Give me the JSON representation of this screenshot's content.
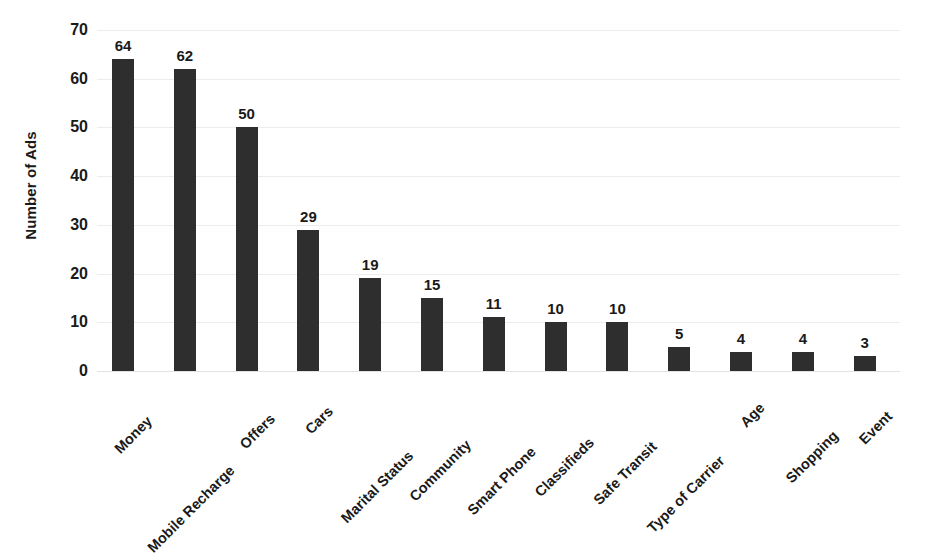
{
  "chart_data": {
    "type": "bar",
    "title": "",
    "subtitle": "",
    "xlabel": "",
    "ylabel": "Number of Ads",
    "categories": [
      "Money",
      "Mobile Recharge",
      "Offers",
      "Cars",
      "Marital Status",
      "Community",
      "Smart Phone",
      "Classifieds",
      "Safe Transit",
      "Type of Carrier",
      "Age",
      "Shopping",
      "Event"
    ],
    "values": [
      64,
      62,
      50,
      29,
      19,
      15,
      11,
      10,
      10,
      5,
      4,
      4,
      3
    ],
    "data_labels": [
      "64",
      "62",
      "50",
      "29",
      "19",
      "15",
      "11",
      "10",
      "10",
      "5",
      "4",
      "4",
      "3"
    ],
    "ylim": [
      0,
      70
    ],
    "ytick_values": [
      0,
      10,
      20,
      30,
      40,
      50,
      60,
      70
    ],
    "ytick_labels": [
      "0",
      "10",
      "20",
      "30",
      "40",
      "50",
      "60",
      "70"
    ],
    "grid": true,
    "grid_axis": "y",
    "legend": false,
    "legend_position": "none",
    "bar_color": "#2e2e2e",
    "grid_color": "#ececed",
    "background_color": "#ffffff",
    "text_color": "#1a1a1a",
    "xtick_rotation": -45
  }
}
